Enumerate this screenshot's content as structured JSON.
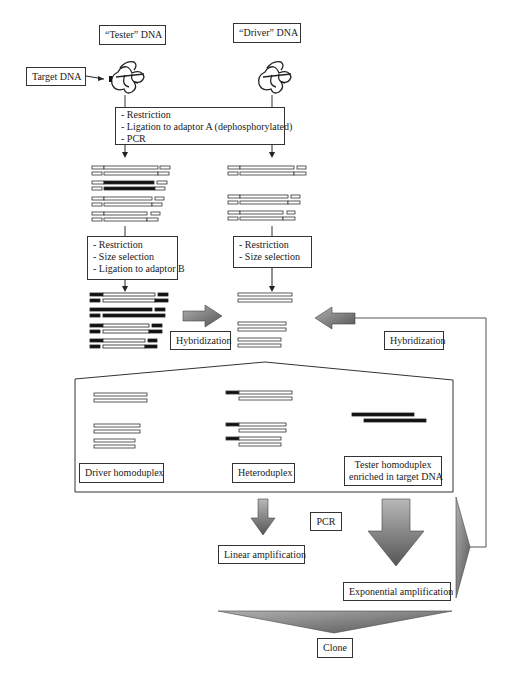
{
  "labels": {
    "tester_dna": "“Tester” DNA",
    "driver_dna": "“Driver” DNA",
    "target_dna": "Target DNA",
    "step1": [
      "- Restriction",
      "- Ligation to adaptor A (dephosphorylated)",
      "- PCR"
    ],
    "step2_tester": [
      "- Restriction",
      "- Size selection",
      "- Ligation to adaptor B"
    ],
    "step2_driver": [
      "- Restriction",
      "- Size selection"
    ],
    "hybridization_left": "Hybridization",
    "hybridization_right": "Hybridization",
    "driver_homoduplex": "Driver homoduplex",
    "heteroduplex": "Heteroduplex",
    "tester_homoduplex": [
      "Tester homoduplex",
      "enriched in target DNA"
    ],
    "pcr": "PCR",
    "linear_amplification": "Linear amplification",
    "exponential_amplification": "Exponential amplification",
    "clone": "Clone"
  },
  "colors": {
    "line": "#333333",
    "strand_fill": "#ffffff",
    "adaptor_fill": "#111111",
    "arrow_fill": "#7a7a7a"
  }
}
